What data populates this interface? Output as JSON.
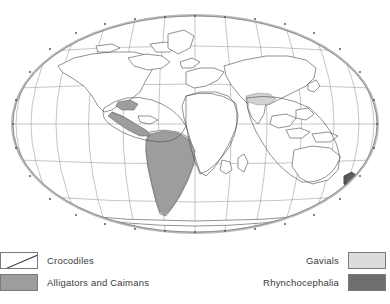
{
  "figure": {
    "name": "world-distribution-map",
    "projection": "elliptical world projection",
    "background_color": "#ffffff"
  },
  "map": {
    "rim_color": "#b9b9b9",
    "graticule_color": "#8d8d8d",
    "coastline_color": "#4a4a4a",
    "regions": [
      {
        "id": "crocodiles",
        "label": "Crocodiles",
        "style": "hatched outline",
        "areas": [
          "Central America and Caribbean",
          "northern South America",
          "sub-Saharan Africa coast",
          "South and Southeast Asia",
          "northern Australia"
        ]
      },
      {
        "id": "alligators-caimans",
        "label": "Alligators and Caimans",
        "style": "solid mid gray",
        "color": "#9d9d9d",
        "areas": [
          "southeastern United States",
          "Central America",
          "South America"
        ]
      },
      {
        "id": "gavials",
        "label": "Gavials",
        "style": "solid light gray",
        "color": "#dcdcdc",
        "areas": [
          "northern Indian subcontinent"
        ]
      },
      {
        "id": "rhynchocephalia",
        "label": "Rhynchocephalia",
        "style": "solid dark gray",
        "color": "#6e6e6e",
        "areas": [
          "New Zealand"
        ]
      }
    ]
  },
  "legend": {
    "left": [
      {
        "label": "Crocodiles",
        "swatch": "hatch",
        "swatch_color": "#ffffff"
      },
      {
        "label": "Alligators and Caimans",
        "swatch": "gray-mid",
        "swatch_color": "#9d9d9d"
      }
    ],
    "right": [
      {
        "label": "Gavials",
        "swatch": "gray-light",
        "swatch_color": "#dcdcdc"
      },
      {
        "label": "Rhynchocephalia",
        "swatch": "gray-dark",
        "swatch_color": "#6e6e6e"
      }
    ]
  },
  "graticule": {
    "longitude_ticks": [
      "180",
      "150",
      "120",
      "90",
      "60",
      "30",
      "0",
      "30",
      "60",
      "90",
      "120",
      "150",
      "180"
    ],
    "latitude_lines": [
      "60N",
      "30N",
      "0",
      "30S",
      "60S"
    ]
  }
}
